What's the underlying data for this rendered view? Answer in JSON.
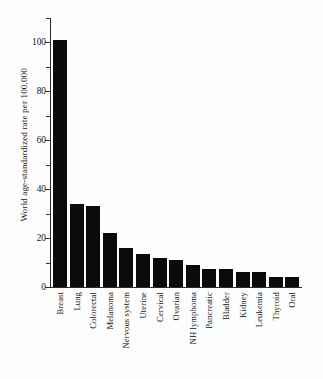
{
  "chart_data": {
    "type": "bar",
    "title": "",
    "subtitle": "",
    "xlabel": "",
    "ylabel": "World age-standardized rate per 100,000",
    "categories": [
      "Breast",
      "Lung",
      "Colorectal",
      "Melanoma",
      "Nervous system",
      "Uterine",
      "Cervical",
      "Ovarian",
      "NH lymphoma",
      "Pancreatic",
      "Bladder",
      "Kidney",
      "Leukemia",
      "Thyroid",
      "Oral"
    ],
    "values": [
      101,
      34,
      33,
      22,
      16,
      13.5,
      12,
      11,
      9,
      7.5,
      7.5,
      6,
      6,
      4,
      4
    ],
    "ylim": [
      0,
      110
    ],
    "yticks": [
      0,
      20,
      40,
      60,
      80,
      100
    ],
    "ytick_labels": [
      "0",
      "20",
      "40",
      "60",
      "80",
      "100"
    ],
    "yminor_ticks": [
      10,
      30,
      50,
      70,
      90,
      110
    ],
    "grid": false,
    "legend": false,
    "legend_position": "none",
    "bar_color": "#0b0b0b",
    "axis_color": "#2b2b2b",
    "background_color": "#ffffff"
  }
}
